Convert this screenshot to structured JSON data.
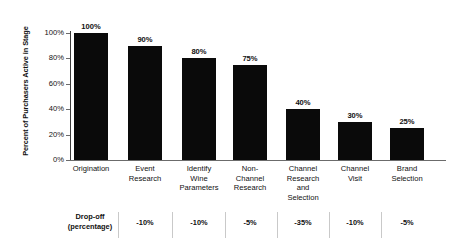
{
  "chart_data": {
    "type": "bar",
    "title": "",
    "xlabel": "",
    "ylabel": "Percent of Purchasers Active in Stage",
    "ylim": [
      0,
      100
    ],
    "grid": false,
    "legend": "none",
    "bar_color": "#0a0a0a",
    "categories": [
      "Origination",
      "Event Research",
      "Identify Wine Parameters",
      "Non-Channel Research",
      "Channel Research and Selection",
      "Channel Visit",
      "Brand Selection"
    ],
    "values": [
      100,
      90,
      80,
      75,
      40,
      30,
      25
    ],
    "value_labels": [
      "100%",
      "90%",
      "80%",
      "75%",
      "40%",
      "30%",
      "25%"
    ],
    "ytick_labels": [
      "0%",
      "20%",
      "40%",
      "60%",
      "80%",
      "100%"
    ],
    "yticks": [
      0,
      20,
      40,
      60,
      80,
      100
    ],
    "annotations": {
      "dropoff_label": "Drop-off (percentage)",
      "dropoff_values": [
        "",
        "-10%",
        "-10%",
        "-5%",
        "-35%",
        "-10%",
        "-5%"
      ]
    }
  },
  "axis": {
    "y_title": "Percent of Purchasers Active in Stage",
    "ticks": [
      {
        "label": "100%"
      },
      {
        "label": "80%"
      },
      {
        "label": "60%"
      },
      {
        "label": "40%"
      },
      {
        "label": "20%"
      },
      {
        "label": "0%"
      }
    ]
  },
  "bars": [
    {
      "value_label": "100%",
      "category_line1": "Origination",
      "category_line2": "",
      "category_line3": "",
      "category_line4": ""
    },
    {
      "value_label": "90%",
      "category_line1": "Event",
      "category_line2": "Research",
      "category_line3": "",
      "category_line4": ""
    },
    {
      "value_label": "80%",
      "category_line1": "Identify",
      "category_line2": "Wine",
      "category_line3": "Parameters",
      "category_line4": ""
    },
    {
      "value_label": "75%",
      "category_line1": "Non-",
      "category_line2": "Channel",
      "category_line3": "Research",
      "category_line4": ""
    },
    {
      "value_label": "40%",
      "category_line1": "Channel",
      "category_line2": "Research",
      "category_line3": "and",
      "category_line4": "Selection"
    },
    {
      "value_label": "30%",
      "category_line1": "Channel",
      "category_line2": "Visit",
      "category_line3": "",
      "category_line4": ""
    },
    {
      "value_label": "25%",
      "category_line1": "Brand",
      "category_line2": "Selection",
      "category_line3": "",
      "category_line4": ""
    }
  ],
  "dropoff": {
    "title_line1": "Drop-off",
    "title_line2": "(percentage)",
    "cells": [
      "-10%",
      "-10%",
      "-5%",
      "-35%",
      "-10%",
      "-5%"
    ]
  }
}
